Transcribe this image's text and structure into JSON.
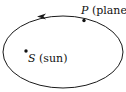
{
  "diagram": {
    "type": "orbit",
    "orbit": {
      "cx": 63,
      "cy": 52,
      "rx": 60,
      "ry": 36,
      "direction": "counterclockwise"
    },
    "planet": {
      "symbol": "P",
      "label": " (planet)",
      "x": 84,
      "y": 20
    },
    "sun": {
      "symbol": "S",
      "label": " (sun)",
      "x": 26,
      "y": 51
    },
    "colors": {
      "stroke": "#1a1a1a",
      "background": "#ffffff"
    }
  }
}
